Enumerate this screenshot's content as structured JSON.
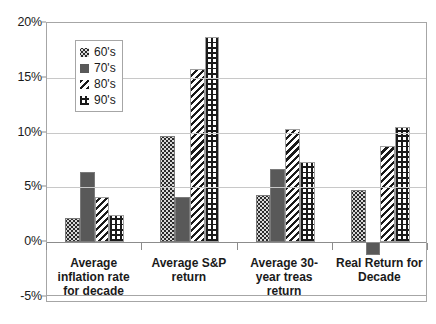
{
  "chart_data": {
    "type": "bar",
    "title": "",
    "subtitle": "",
    "xlabel": "",
    "ylabel": "",
    "ylim": [
      -5,
      20
    ],
    "ytick_labels": [
      "20%",
      "15%",
      "10%",
      "5%",
      "0%",
      "-5%"
    ],
    "ytick_values": [
      20,
      15,
      10,
      5,
      0,
      -5
    ],
    "grid": true,
    "legend_position": "inside-top-left",
    "categories": [
      "Average inflation rate for decade",
      "Average S&P return",
      "Average 30-year treas return",
      "Real Return for Decade"
    ],
    "category_lines": [
      [
        "Average",
        "inflation rate",
        "for decade"
      ],
      [
        "Average S&P",
        "return"
      ],
      [
        "Average 30-",
        "year treas",
        "return"
      ],
      [
        "Real Return for",
        "Decade"
      ]
    ],
    "series": [
      {
        "name": "60's",
        "pattern": "dark-dotted",
        "values": [
          2.2,
          9.7,
          4.3,
          4.8
        ]
      },
      {
        "name": "70's",
        "pattern": "solid-gray",
        "values": [
          6.4,
          4.1,
          6.7,
          -1.2
        ]
      },
      {
        "name": "80's",
        "pattern": "diagonal-hatch",
        "values": [
          4.1,
          15.8,
          10.3,
          8.8
        ]
      },
      {
        "name": "90's",
        "pattern": "grid-checker",
        "values": [
          2.5,
          18.7,
          7.3,
          10.5
        ]
      }
    ],
    "colors": {
      "series_60s": "#2b2b2b",
      "series_70s": "#595959",
      "series_80s": "#1a1a1a",
      "series_90s": "#1a1a1a",
      "gridline": "#c8c8c8",
      "zero_line": "#8c8c8c",
      "axis_border": "#a6a6a6",
      "text": "#1a1a1a",
      "background": "#ffffff"
    }
  },
  "legend": {
    "items": [
      {
        "label": "60's"
      },
      {
        "label": "70's"
      },
      {
        "label": "80's"
      },
      {
        "label": "90's"
      }
    ]
  }
}
